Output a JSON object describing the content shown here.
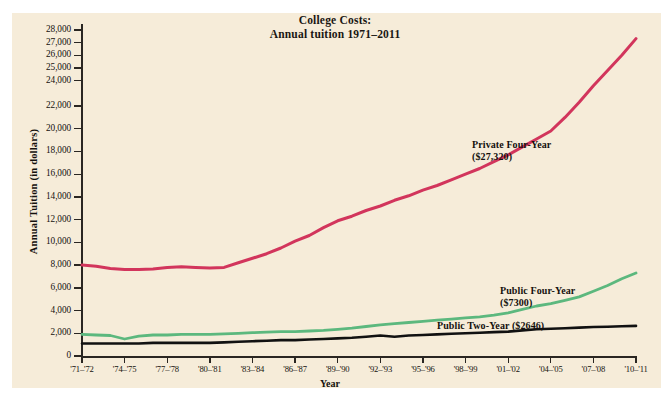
{
  "figure": {
    "title_line1": "College Costs:",
    "title_line2": "Annual tuition 1971–2011",
    "y_axis_title": "Annual Tuition (in dollars)",
    "x_axis_title": "Year",
    "panel_color": "#f6ecd9",
    "page_color": "#ffffff",
    "axis_color": "#2a2622"
  },
  "annotations": {
    "private": {
      "name": "Private Four-Year",
      "value": "($27,320)"
    },
    "public4": {
      "name": "Public Four-Year",
      "value": "($7300)"
    },
    "public2": {
      "name": "Public Two-Year ($2646)"
    }
  },
  "chart_data": {
    "type": "line",
    "title": "College Costs: Annual tuition 1971–2011",
    "xlabel": "Year",
    "ylabel": "Annual Tuition (in dollars)",
    "grid": false,
    "legend": "inline-annotations",
    "ylim": [
      0,
      28000
    ],
    "y_ticks": [
      0,
      2000,
      4000,
      6000,
      8000,
      10000,
      12000,
      14000,
      16000,
      18000,
      20000,
      22000,
      24000,
      25000,
      26000,
      27000,
      28000
    ],
    "y_tick_labels": [
      "0",
      "2,000",
      "4,000",
      "6,000",
      "8,000",
      "10,000",
      "12,000",
      "14,000",
      "16,000",
      "18,000",
      "20,000",
      "22,000",
      "24,000",
      "25,000",
      "26,000",
      "27,000",
      "28,000"
    ],
    "y_axis_note": "Scale is compressed above 22,000: 22,000–28,000 shown in 1,000 steps",
    "x_tick_labels": [
      "'71–'72",
      "'74–'75",
      "'77–'78",
      "'80–'81",
      "'83–'84",
      "'86–'87",
      "'89–'90",
      "'92–'93",
      "'95–'96",
      "'98–'99",
      "'01–'02",
      "'04–'05",
      "'07–'08",
      "'10–'11"
    ],
    "x_categories": [
      "1971-72",
      "1972-73",
      "1973-74",
      "1974-75",
      "1975-76",
      "1976-77",
      "1977-78",
      "1978-79",
      "1979-80",
      "1980-81",
      "1981-82",
      "1982-83",
      "1983-84",
      "1984-85",
      "1985-86",
      "1986-87",
      "1987-88",
      "1988-89",
      "1989-90",
      "1990-91",
      "1991-92",
      "1992-93",
      "1993-94",
      "1994-95",
      "1995-96",
      "1996-97",
      "1997-98",
      "1998-99",
      "1999-00",
      "2000-01",
      "2001-02",
      "2002-03",
      "2003-04",
      "2004-05",
      "2005-06",
      "2006-07",
      "2007-08",
      "2008-09",
      "2009-10",
      "2010-11"
    ],
    "series": [
      {
        "name": "Private Four-Year",
        "color": "#d2355c",
        "final_value": 27320,
        "final_label": "($27,320)",
        "values": [
          8000,
          7900,
          7700,
          7600,
          7600,
          7650,
          7800,
          7850,
          7800,
          7750,
          7800,
          8200,
          8600,
          9000,
          9500,
          10100,
          10600,
          11300,
          11900,
          12300,
          12800,
          13200,
          13700,
          14100,
          14600,
          15000,
          15500,
          16000,
          16500,
          17100,
          17700,
          18400,
          19100,
          19800,
          21000,
          22300,
          23600,
          24800,
          26000,
          27320
        ]
      },
      {
        "name": "Public Four-Year",
        "color": "#5cb87e",
        "final_value": 7300,
        "final_label": "($7300)",
        "values": [
          1900,
          1850,
          1800,
          1500,
          1750,
          1850,
          1850,
          1900,
          1900,
          1900,
          1950,
          2000,
          2050,
          2100,
          2150,
          2150,
          2200,
          2250,
          2350,
          2450,
          2600,
          2750,
          2850,
          2950,
          3050,
          3150,
          3250,
          3350,
          3450,
          3600,
          3800,
          4100,
          4400,
          4600,
          4900,
          5200,
          5700,
          6200,
          6800,
          7300
        ]
      },
      {
        "name": "Public Two-Year",
        "color": "#111111",
        "final_value": 2646,
        "final_label": "($2646)",
        "values": [
          1100,
          1100,
          1100,
          1100,
          1100,
          1150,
          1150,
          1150,
          1150,
          1150,
          1200,
          1250,
          1300,
          1350,
          1400,
          1400,
          1450,
          1500,
          1550,
          1600,
          1700,
          1800,
          1700,
          1800,
          1850,
          1900,
          1950,
          2000,
          2050,
          2100,
          2150,
          2250,
          2350,
          2400,
          2450,
          2500,
          2550,
          2580,
          2620,
          2646
        ]
      }
    ]
  }
}
